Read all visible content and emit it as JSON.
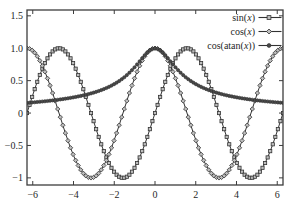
{
  "figure": {
    "width": 290,
    "height": 217,
    "background": "#ffffff",
    "frame_color": "#3d3d3d",
    "curve_color": "#333333",
    "text_color": "#1f1f1f",
    "marker_open_fill": "#bdbdbd",
    "marker_solid_fill": "#4a4a4a",
    "plot_rect": {
      "left": 27,
      "top": 10,
      "right": 283,
      "bottom": 185
    }
  },
  "chart_data": {
    "type": "line",
    "title": "",
    "xlabel": "",
    "ylabel": "",
    "grid": false,
    "legend_position": "top-right-inside",
    "xlim": [
      -6.283,
      6.283
    ],
    "ylim": [
      -1.11,
      1.59
    ],
    "xticks": [
      {
        "value": -6,
        "label": "−6"
      },
      {
        "value": -4,
        "label": "−4"
      },
      {
        "value": -2,
        "label": "−2"
      },
      {
        "value": 0,
        "label": "0"
      },
      {
        "value": 2,
        "label": "2"
      },
      {
        "value": 4,
        "label": "4"
      },
      {
        "value": 6,
        "label": "6"
      }
    ],
    "yticks": [
      {
        "value": 1.5,
        "label": "1.5"
      },
      {
        "value": 1.0,
        "label": "1.0"
      },
      {
        "value": 0.5,
        "label": "0.5"
      },
      {
        "value": 0,
        "label": "0"
      },
      {
        "value": -0.5,
        "label": "−0.5"
      },
      {
        "value": -1,
        "label": "−1"
      }
    ],
    "samples_per_series": 100,
    "series": [
      {
        "name": "sin(x)",
        "expression": "sin(x)",
        "marker": "square",
        "points": [
          [
            -6,
            0.279
          ],
          [
            -5.5,
            0.706
          ],
          [
            -5,
            0.959
          ],
          [
            -4.5,
            0.978
          ],
          [
            -4,
            0.757
          ],
          [
            -3.5,
            0.351
          ],
          [
            -3,
            -0.141
          ],
          [
            -2.5,
            -0.599
          ],
          [
            -2,
            -0.909
          ],
          [
            -1.5,
            -0.997
          ],
          [
            -1,
            -0.841
          ],
          [
            -0.5,
            -0.479
          ],
          [
            0,
            0
          ],
          [
            0.5,
            0.479
          ],
          [
            1,
            0.841
          ],
          [
            1.5,
            0.997
          ],
          [
            2,
            0.909
          ],
          [
            2.5,
            0.599
          ],
          [
            3,
            0.141
          ],
          [
            3.5,
            -0.351
          ],
          [
            4,
            -0.757
          ],
          [
            4.5,
            -0.978
          ],
          [
            5,
            -0.959
          ],
          [
            5.5,
            -0.706
          ],
          [
            6,
            -0.279
          ]
        ]
      },
      {
        "name": "cos(x)",
        "expression": "cos(x)",
        "marker": "diamond",
        "points": [
          [
            -6,
            0.96
          ],
          [
            -5.5,
            0.709
          ],
          [
            -5,
            0.284
          ],
          [
            -4.5,
            -0.211
          ],
          [
            -4,
            -0.654
          ],
          [
            -3.5,
            -0.936
          ],
          [
            -3,
            -0.99
          ],
          [
            -2.5,
            -0.801
          ],
          [
            -2,
            -0.416
          ],
          [
            -1.5,
            0.071
          ],
          [
            -1,
            0.54
          ],
          [
            -0.5,
            0.878
          ],
          [
            0,
            1
          ],
          [
            0.5,
            0.878
          ],
          [
            1,
            0.54
          ],
          [
            1.5,
            0.071
          ],
          [
            2,
            -0.416
          ],
          [
            2.5,
            -0.801
          ],
          [
            3,
            -0.99
          ],
          [
            3.5,
            -0.936
          ],
          [
            4,
            -0.654
          ],
          [
            4.5,
            -0.211
          ],
          [
            5,
            0.284
          ],
          [
            5.5,
            0.709
          ],
          [
            6,
            0.96
          ]
        ]
      },
      {
        "name": "cos(atan(x))",
        "expression": "cos(atan(x))",
        "marker": "circle",
        "points": [
          [
            -6,
            0.164
          ],
          [
            -5.5,
            0.179
          ],
          [
            -5,
            0.196
          ],
          [
            -4.5,
            0.217
          ],
          [
            -4,
            0.243
          ],
          [
            -3.5,
            0.275
          ],
          [
            -3,
            0.316
          ],
          [
            -2.5,
            0.371
          ],
          [
            -2,
            0.447
          ],
          [
            -1.5,
            0.555
          ],
          [
            -1,
            0.707
          ],
          [
            -0.5,
            0.894
          ],
          [
            0,
            1
          ],
          [
            0.5,
            0.894
          ],
          [
            1,
            0.707
          ],
          [
            1.5,
            0.555
          ],
          [
            2,
            0.447
          ],
          [
            2.5,
            0.371
          ],
          [
            3,
            0.316
          ],
          [
            3.5,
            0.275
          ],
          [
            4,
            0.243
          ],
          [
            4.5,
            0.217
          ],
          [
            5,
            0.196
          ],
          [
            5.5,
            0.179
          ],
          [
            6,
            0.164
          ]
        ]
      }
    ]
  }
}
